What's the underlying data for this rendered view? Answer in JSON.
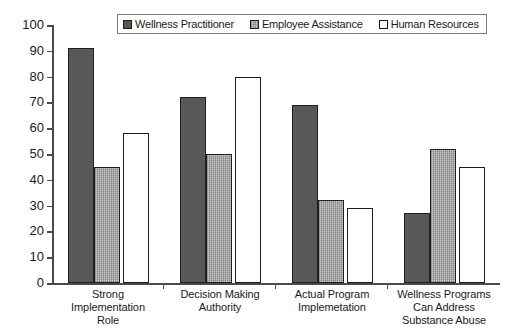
{
  "chart_data": {
    "type": "bar",
    "title": "",
    "xlabel": "",
    "ylabel": "",
    "ylim": [
      0,
      100
    ],
    "yticks": [
      100,
      90,
      80,
      70,
      60,
      50,
      40,
      30,
      20,
      10,
      0
    ],
    "grid": false,
    "legend_position": "top-center",
    "categories": [
      "Strong Implementation Role",
      "Decision Making Authority",
      "Actual Program Implemetation",
      "Wellness Programs Can Address Substance Abuse"
    ],
    "category_lines": [
      [
        "Strong Implementation",
        "Role"
      ],
      [
        "Decision Making",
        "Authority"
      ],
      [
        "Actual Program",
        "Implemetation"
      ],
      [
        "Wellness Programs",
        "Can Address",
        "Substance Abuse"
      ]
    ],
    "series": [
      {
        "name": "Wellness Practitioner",
        "color": "#585858",
        "pattern": "solid-dark-gray",
        "values": [
          91,
          72,
          69,
          27
        ]
      },
      {
        "name": "Employee Assistance",
        "color": "#c9c9c9",
        "pattern": "light-gray-crosshatch",
        "values": [
          45,
          50,
          32,
          52
        ]
      },
      {
        "name": "Human Resources",
        "color": "#ffffff",
        "pattern": "white-outline",
        "values": [
          58,
          80,
          29,
          45
        ]
      }
    ]
  },
  "axis": {
    "line_color": "#4a4a4a",
    "bar_border_color": "#1f1f1f"
  }
}
